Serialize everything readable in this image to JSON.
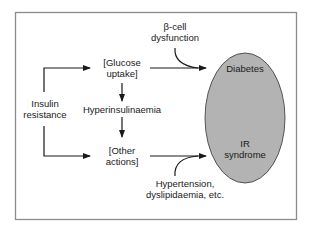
{
  "diagram": {
    "nodes": {
      "insulin_resistance": {
        "line1": "Insulin",
        "line2": "resistance"
      },
      "glucose_uptake": {
        "line1": "[Glucose",
        "line2": "uptake]"
      },
      "hyperinsulinaemia": {
        "label": "Hyperinsulinaemia"
      },
      "other_actions": {
        "line1": "[Other",
        "line2": "actions]"
      },
      "beta_cell": {
        "line1": "β-cell",
        "line2": "dysfunction"
      },
      "hypertension": {
        "line1": "Hypertension,",
        "line2": "dyslipidaemia, etc."
      },
      "diabetes": {
        "label": "Diabetes"
      },
      "ir_syndrome": {
        "line1": "IR",
        "line2": "syndrome"
      }
    },
    "colors": {
      "ellipse_fill": "#b3b3b3",
      "stroke": "#1a1a1a",
      "frame": "#8c8c8c"
    },
    "edges": [
      {
        "from": "Insulin resistance",
        "to": "[Glucose uptake]"
      },
      {
        "from": "Insulin resistance",
        "to": "[Other actions]"
      },
      {
        "from": "[Glucose uptake]",
        "to": "Hyperinsulinaemia"
      },
      {
        "from": "Hyperinsulinaemia",
        "to": "[Other actions]"
      },
      {
        "from": "[Glucose uptake]",
        "to": "Diabetes"
      },
      {
        "from": "[Other actions]",
        "to": "IR syndrome"
      },
      {
        "from": "β-cell dysfunction",
        "to": "Diabetes arrow"
      },
      {
        "from": "Hypertension, dyslipidaemia, etc.",
        "to": "IR syndrome arrow"
      }
    ]
  }
}
